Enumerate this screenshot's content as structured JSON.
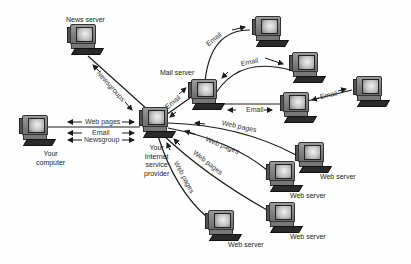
{
  "diagram": {
    "nodes": [
      {
        "id": "news",
        "label": "News server",
        "x": 66,
        "y": 24
      },
      {
        "id": "mail",
        "label": "Mail server",
        "x": 187,
        "y": 79
      },
      {
        "id": "isp",
        "label": "Your\nInternet\nservice\nprovider",
        "x": 138,
        "y": 107
      },
      {
        "id": "you",
        "label": "Your\ncomputer",
        "x": 18,
        "y": 115
      },
      {
        "id": "mail_c1",
        "label": "",
        "x": 251,
        "y": 16
      },
      {
        "id": "mail_c2",
        "label": "",
        "x": 288,
        "y": 52
      },
      {
        "id": "mail_c3",
        "label": "",
        "x": 279,
        "y": 92
      },
      {
        "id": "mail_c4",
        "label": "",
        "x": 352,
        "y": 76
      },
      {
        "id": "web1",
        "label": "Web server",
        "x": 294,
        "y": 142
      },
      {
        "id": "web2",
        "label": "Web server",
        "x": 265,
        "y": 161
      },
      {
        "id": "web3",
        "label": "Web server",
        "x": 265,
        "y": 202
      },
      {
        "id": "web4",
        "label": "Web server",
        "x": 204,
        "y": 210
      }
    ],
    "node_labels": {
      "news": "News server",
      "mail": "Mail server",
      "isp": [
        "Your",
        "Internet",
        "service",
        "provider"
      ],
      "you": [
        "Your",
        "computer"
      ],
      "web1": "Web server",
      "web2": "Web server",
      "web3": "Web server",
      "web4": "Web server"
    },
    "edge_labels": {
      "you_isp_web": "Web pages",
      "you_isp_email": "Email",
      "you_isp_news": "Newsgroup",
      "news_isp": "Newsgroups",
      "isp_mail": "Email",
      "mail_c1": "Email",
      "mail_c2": "Email",
      "mail_c3": "Email",
      "c3_c4": "Email",
      "isp_web1": "Web pages",
      "isp_web2": "Web pages",
      "isp_web3": "Web pages",
      "isp_web4": "Web pages"
    }
  },
  "colors": {
    "line": "#1a1a1a",
    "text": "#222222",
    "background": "#fefefe"
  }
}
